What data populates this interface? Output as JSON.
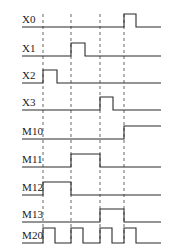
{
  "diagram": {
    "type": "timing-waveform",
    "width": 170,
    "height": 251,
    "background_color": "#ffffff",
    "wave_color": "#2b2b2b",
    "marker_color": "#555555",
    "label_color": "#1a1a1a"
  },
  "axis": {
    "x_start": 22,
    "x_end": 161,
    "time_markers": [
      43,
      71,
      100,
      124
    ],
    "marker_top": 14,
    "marker_bottom": 243
  },
  "signals": [
    {
      "name": "X0",
      "label": "X0",
      "baseline_y": 27,
      "high_y": 14,
      "label_x": 22,
      "label_y": 23,
      "segments": [
        {
          "t": 22,
          "level": 0
        },
        {
          "t": 124,
          "level": 1
        },
        {
          "t": 136,
          "level": 0
        },
        {
          "t": 161,
          "level": 0
        }
      ]
    },
    {
      "name": "X1",
      "label": "X1",
      "baseline_y": 56,
      "high_y": 43,
      "label_x": 22,
      "label_y": 52,
      "segments": [
        {
          "t": 22,
          "level": 0
        },
        {
          "t": 71,
          "level": 1
        },
        {
          "t": 85,
          "level": 0
        },
        {
          "t": 161,
          "level": 0
        }
      ]
    },
    {
      "name": "X2",
      "label": "X2",
      "baseline_y": 83,
      "high_y": 70,
      "label_x": 22,
      "label_y": 79,
      "segments": [
        {
          "t": 22,
          "level": 0
        },
        {
          "t": 43,
          "level": 1
        },
        {
          "t": 57,
          "level": 0
        },
        {
          "t": 161,
          "level": 0
        }
      ]
    },
    {
      "name": "X3",
      "label": "X3",
      "baseline_y": 110,
      "high_y": 97,
      "label_x": 22,
      "label_y": 106,
      "segments": [
        {
          "t": 22,
          "level": 0
        },
        {
          "t": 100,
          "level": 1
        },
        {
          "t": 113,
          "level": 0
        },
        {
          "t": 161,
          "level": 0
        }
      ]
    },
    {
      "name": "M10",
      "label": "M10",
      "baseline_y": 139,
      "high_y": 126,
      "label_x": 22,
      "label_y": 135,
      "segments": [
        {
          "t": 22,
          "level": 0
        },
        {
          "t": 124,
          "level": 1
        },
        {
          "t": 161,
          "level": 1
        }
      ]
    },
    {
      "name": "M11",
      "label": "M11",
      "baseline_y": 167,
      "high_y": 154,
      "label_x": 22,
      "label_y": 163,
      "segments": [
        {
          "t": 22,
          "level": 0
        },
        {
          "t": 71,
          "level": 1
        },
        {
          "t": 100,
          "level": 0
        },
        {
          "t": 161,
          "level": 0
        }
      ]
    },
    {
      "name": "M12",
      "label": "M12",
      "baseline_y": 195,
      "high_y": 182,
      "label_x": 22,
      "label_y": 191,
      "segments": [
        {
          "t": 22,
          "level": 0
        },
        {
          "t": 43,
          "level": 1
        },
        {
          "t": 71,
          "level": 0
        },
        {
          "t": 161,
          "level": 0
        }
      ]
    },
    {
      "name": "M13",
      "label": "M13",
      "baseline_y": 222,
      "high_y": 209,
      "label_x": 22,
      "label_y": 218,
      "segments": [
        {
          "t": 22,
          "level": 0
        },
        {
          "t": 100,
          "level": 1
        },
        {
          "t": 124,
          "level": 0
        },
        {
          "t": 161,
          "level": 0
        }
      ]
    },
    {
      "name": "M20",
      "label": "M20",
      "baseline_y": 243,
      "high_y": 228,
      "label_x": 22,
      "label_y": 239,
      "segments": [
        {
          "t": 22,
          "level": 0
        },
        {
          "t": 43,
          "level": 1
        },
        {
          "t": 55,
          "level": 0
        },
        {
          "t": 71,
          "level": 1
        },
        {
          "t": 83,
          "level": 0
        },
        {
          "t": 100,
          "level": 1
        },
        {
          "t": 112,
          "level": 0
        },
        {
          "t": 124,
          "level": 1
        },
        {
          "t": 136,
          "level": 0
        },
        {
          "t": 161,
          "level": 0
        }
      ]
    }
  ]
}
